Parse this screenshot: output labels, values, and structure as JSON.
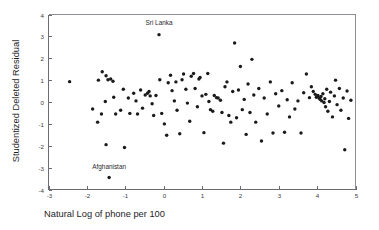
{
  "chart_data": {
    "type": "scatter",
    "title": "",
    "xlabel": "Natural Log of phone per 100",
    "ylabel": "Studentized Deleted Residual",
    "xlim": [
      -3,
      5
    ],
    "ylim": [
      -4,
      4
    ],
    "xticks": [
      -3,
      -2,
      -1,
      0,
      1,
      2,
      3,
      4,
      5
    ],
    "xticklabels": [
      "-3",
      "-2",
      "-1",
      "0",
      "1",
      "2",
      "3",
      "4",
      "5"
    ],
    "yticks": [
      -4,
      -3,
      -2,
      -1,
      0,
      1,
      2,
      3,
      4
    ],
    "yticklabels": [
      "-4",
      "-3",
      "-2",
      "-1",
      "0",
      "1",
      "2",
      "3",
      "4"
    ],
    "grid": false,
    "legend": null,
    "marker": "circle",
    "marker_color": "#1a1a1c",
    "marker_size": 2,
    "annotations": [
      {
        "text": "Sri Lanka",
        "x": -0.12,
        "y": 3.52,
        "point_x": -0.12,
        "point_y": 3.08
      },
      {
        "text": "Afghanistan",
        "x": -1.42,
        "y": -3.07,
        "point_x": -1.42,
        "point_y": -3.45
      }
    ],
    "points": [
      {
        "x": -2.45,
        "y": 0.93
      },
      {
        "x": -1.7,
        "y": 1.0
      },
      {
        "x": -1.6,
        "y": 1.38
      },
      {
        "x": -1.5,
        "y": 1.2
      },
      {
        "x": -1.45,
        "y": 1.02
      },
      {
        "x": -1.38,
        "y": 1.05
      },
      {
        "x": -1.32,
        "y": 0.95
      },
      {
        "x": -1.3,
        "y": 0.22
      },
      {
        "x": -1.52,
        "y": 0.02
      },
      {
        "x": -1.85,
        "y": -0.32
      },
      {
        "x": -1.72,
        "y": -0.92
      },
      {
        "x": -1.62,
        "y": -0.55
      },
      {
        "x": -1.5,
        "y": -1.95
      },
      {
        "x": -1.42,
        "y": -3.45
      },
      {
        "x": -1.25,
        "y": -0.55
      },
      {
        "x": -1.12,
        "y": -0.38
      },
      {
        "x": -1.05,
        "y": 0.58
      },
      {
        "x": -1.02,
        "y": -2.08
      },
      {
        "x": -0.92,
        "y": 0.18
      },
      {
        "x": -0.88,
        "y": -0.52
      },
      {
        "x": -0.78,
        "y": 0.4
      },
      {
        "x": -0.72,
        "y": 0.05
      },
      {
        "x": -0.68,
        "y": -0.55
      },
      {
        "x": -0.6,
        "y": 0.55
      },
      {
        "x": -0.55,
        "y": -0.28
      },
      {
        "x": -0.48,
        "y": 0.32
      },
      {
        "x": -0.42,
        "y": 0.4
      },
      {
        "x": -0.38,
        "y": 0.48
      },
      {
        "x": -0.35,
        "y": 0.28
      },
      {
        "x": -0.3,
        "y": -0.08
      },
      {
        "x": -0.26,
        "y": -0.62
      },
      {
        "x": -0.2,
        "y": 0.3
      },
      {
        "x": -0.12,
        "y": 3.08
      },
      {
        "x": -0.1,
        "y": 1.02
      },
      {
        "x": -0.05,
        "y": -0.52
      },
      {
        "x": 0.02,
        "y": -1.0
      },
      {
        "x": 0.08,
        "y": -1.52
      },
      {
        "x": 0.12,
        "y": 0.88
      },
      {
        "x": 0.18,
        "y": 1.22
      },
      {
        "x": 0.22,
        "y": 0.52
      },
      {
        "x": 0.28,
        "y": 0.05
      },
      {
        "x": 0.32,
        "y": 0.92
      },
      {
        "x": 0.35,
        "y": -0.38
      },
      {
        "x": 0.42,
        "y": -1.45
      },
      {
        "x": 0.48,
        "y": 1.02
      },
      {
        "x": 0.52,
        "y": 1.28
      },
      {
        "x": 0.58,
        "y": 0.58
      },
      {
        "x": 0.62,
        "y": -0.05
      },
      {
        "x": 0.68,
        "y": -0.88
      },
      {
        "x": 0.72,
        "y": 1.18
      },
      {
        "x": 0.78,
        "y": 1.3
      },
      {
        "x": 0.82,
        "y": 0.62
      },
      {
        "x": 0.88,
        "y": -0.22
      },
      {
        "x": 0.92,
        "y": 1.05
      },
      {
        "x": 0.95,
        "y": 1.12
      },
      {
        "x": 1.0,
        "y": 0.28
      },
      {
        "x": 1.05,
        "y": -1.4
      },
      {
        "x": 1.1,
        "y": 0.35
      },
      {
        "x": 1.15,
        "y": 1.3
      },
      {
        "x": 1.18,
        "y": 0.02
      },
      {
        "x": 1.22,
        "y": -0.35
      },
      {
        "x": 1.28,
        "y": -0.42
      },
      {
        "x": 1.32,
        "y": 0.3
      },
      {
        "x": 1.38,
        "y": 0.2
      },
      {
        "x": 1.42,
        "y": 0.18
      },
      {
        "x": 1.48,
        "y": 0.08
      },
      {
        "x": 1.52,
        "y": -0.48
      },
      {
        "x": 1.56,
        "y": -1.88
      },
      {
        "x": 1.6,
        "y": 0.7
      },
      {
        "x": 1.65,
        "y": 0.92
      },
      {
        "x": 1.7,
        "y": -0.62
      },
      {
        "x": 1.75,
        "y": -0.92
      },
      {
        "x": 1.8,
        "y": 0.48
      },
      {
        "x": 1.85,
        "y": 2.7
      },
      {
        "x": 1.9,
        "y": -0.72
      },
      {
        "x": 1.95,
        "y": 0.55
      },
      {
        "x": 2.0,
        "y": 1.62
      },
      {
        "x": 2.05,
        "y": -0.35
      },
      {
        "x": 2.1,
        "y": 0.12
      },
      {
        "x": 2.15,
        "y": -1.48
      },
      {
        "x": 2.2,
        "y": 0.82
      },
      {
        "x": 2.25,
        "y": -0.48
      },
      {
        "x": 2.3,
        "y": 1.95
      },
      {
        "x": 2.35,
        "y": 0.32
      },
      {
        "x": 2.4,
        "y": -0.92
      },
      {
        "x": 2.48,
        "y": 0.62
      },
      {
        "x": 2.55,
        "y": -1.78
      },
      {
        "x": 2.62,
        "y": 0.18
      },
      {
        "x": 2.7,
        "y": -0.55
      },
      {
        "x": 2.78,
        "y": 0.92
      },
      {
        "x": 2.85,
        "y": -1.42
      },
      {
        "x": 2.92,
        "y": 0.38
      },
      {
        "x": 3.0,
        "y": -0.18
      },
      {
        "x": 3.08,
        "y": 0.52
      },
      {
        "x": 3.15,
        "y": -1.38
      },
      {
        "x": 3.22,
        "y": 0.1
      },
      {
        "x": 3.28,
        "y": -0.68
      },
      {
        "x": 3.35,
        "y": 0.88
      },
      {
        "x": 3.42,
        "y": -0.32
      },
      {
        "x": 3.5,
        "y": 0.05
      },
      {
        "x": 3.58,
        "y": -1.42
      },
      {
        "x": 3.65,
        "y": 0.42
      },
      {
        "x": 3.72,
        "y": 1.28
      },
      {
        "x": 3.8,
        "y": 0.2
      },
      {
        "x": 3.85,
        "y": 0.7
      },
      {
        "x": 3.9,
        "y": 0.48
      },
      {
        "x": 3.95,
        "y": 0.35
      },
      {
        "x": 3.98,
        "y": 0.22
      },
      {
        "x": 4.02,
        "y": 0.3
      },
      {
        "x": 4.05,
        "y": 0.18
      },
      {
        "x": 4.08,
        "y": 0.12
      },
      {
        "x": 4.1,
        "y": 0.25
      },
      {
        "x": 4.12,
        "y": 0.05
      },
      {
        "x": 4.15,
        "y": 0.38
      },
      {
        "x": 4.18,
        "y": -0.02
      },
      {
        "x": 4.2,
        "y": 0.15
      },
      {
        "x": 4.22,
        "y": -0.22
      },
      {
        "x": 4.25,
        "y": 0.58
      },
      {
        "x": 4.28,
        "y": -0.42
      },
      {
        "x": 4.32,
        "y": 0.02
      },
      {
        "x": 4.35,
        "y": 0.45
      },
      {
        "x": 4.4,
        "y": -0.68
      },
      {
        "x": 4.45,
        "y": 0.28
      },
      {
        "x": 4.48,
        "y": 1.0
      },
      {
        "x": 4.52,
        "y": -0.12
      },
      {
        "x": 4.58,
        "y": 0.62
      },
      {
        "x": 4.62,
        "y": -0.38
      },
      {
        "x": 4.68,
        "y": 0.18
      },
      {
        "x": 4.72,
        "y": -2.18
      },
      {
        "x": 4.78,
        "y": 0.5
      },
      {
        "x": 4.82,
        "y": -0.75
      },
      {
        "x": 4.88,
        "y": 0.08
      }
    ]
  }
}
